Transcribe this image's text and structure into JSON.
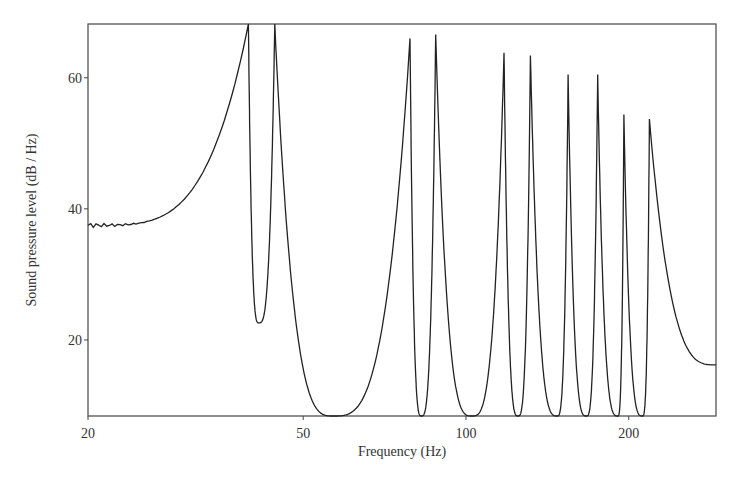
{
  "chart_data": {
    "type": "line",
    "title": "",
    "xlabel": "Frequency (Hz)",
    "ylabel": "Sound pressure level (dB / Hz)",
    "xscale": "log",
    "xlim": [
      20,
      290
    ],
    "ylim": [
      8.4,
      68.2
    ],
    "xticks": [
      20,
      50,
      100,
      200
    ],
    "xtick_labels": [
      "20",
      "50",
      "100",
      "200"
    ],
    "yticks": [
      20,
      40,
      60
    ],
    "ytick_labels": [
      "20",
      "40",
      "60"
    ],
    "grid": false,
    "legend": "none",
    "line_color": "#222222",
    "series": [
      {
        "name": "SPL",
        "low_frequency_start": {
          "f": 20,
          "db": 37.5
        },
        "resonances": [
          {
            "f": 39.6,
            "db": 68.2
          },
          {
            "f": 44.3,
            "db": 68.2
          },
          {
            "f": 78.8,
            "db": 66.0
          },
          {
            "f": 87.9,
            "db": 66.6
          },
          {
            "f": 117.6,
            "db": 63.8
          },
          {
            "f": 131.6,
            "db": 63.4
          },
          {
            "f": 154.5,
            "db": 60.5
          },
          {
            "f": 175.2,
            "db": 60.5
          },
          {
            "f": 195.9,
            "db": 54.4
          },
          {
            "f": 218.4,
            "db": 53.7
          }
        ],
        "antiresonances": [
          {
            "f": 41.4,
            "db": 22.6
          },
          {
            "f": 56.9,
            "db": 8.4
          },
          {
            "f": 82.7,
            "db": 8.4
          },
          {
            "f": 102.6,
            "db": 8.4
          },
          {
            "f": 124.8,
            "db": 8.4
          },
          {
            "f": 147.5,
            "db": 8.4
          },
          {
            "f": 167.0,
            "db": 8.4
          },
          {
            "f": 190.9,
            "db": 8.4
          },
          {
            "f": 212.0,
            "db": 8.4
          }
        ],
        "high_frequency_end": {
          "f": 290,
          "db": 16.2
        }
      }
    ]
  }
}
